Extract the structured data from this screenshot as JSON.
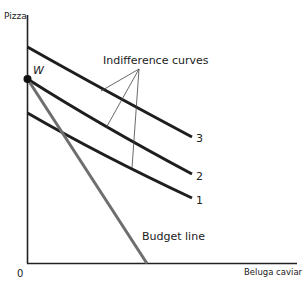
{
  "diagram": {
    "y_axis_label": "Pizza",
    "x_axis_label": "Beluga caviar",
    "origin_label": "0",
    "point_label": "W",
    "indifference_label": "Indifference curves",
    "budget_label": "Budget line",
    "curve_labels": [
      "3",
      "2",
      "1"
    ],
    "colors": {
      "axis": "#222222",
      "curves": "#1e1e1e",
      "budget_line": "#6e6e6e",
      "pointers": "#444444"
    }
  }
}
